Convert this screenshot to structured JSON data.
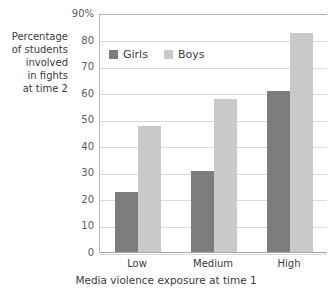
{
  "chart_data": {
    "type": "bar",
    "title": "",
    "categories": [
      "Low",
      "Medium",
      "High"
    ],
    "series": [
      {
        "name": "Girls",
        "values": [
          23,
          31,
          61
        ],
        "color": "#7d7d7d"
      },
      {
        "name": "Boys",
        "values": [
          48,
          58,
          83
        ],
        "color": "#c9c9c9"
      }
    ],
    "xlabel": "Media violence exposure at time 1",
    "ylabel": "Percentage of students involved in fights at time 2",
    "ylim": [
      0,
      90
    ],
    "ytick_values": [
      0,
      10,
      20,
      30,
      40,
      50,
      60,
      70,
      80,
      90
    ],
    "ytick_labels": [
      "0",
      "10",
      "20",
      "30",
      "40",
      "50",
      "60",
      "70",
      "80",
      "90%"
    ],
    "grid": true,
    "legend_position": "upper-left-inside"
  },
  "y_axis": {
    "caption_lines": [
      "Percentage",
      "of students",
      "involved",
      "in fights",
      "at time 2"
    ]
  },
  "legend": {
    "items": [
      {
        "label": "Girls"
      },
      {
        "label": "Boys"
      }
    ]
  }
}
